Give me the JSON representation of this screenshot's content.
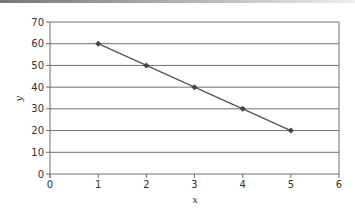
{
  "chart_data": {
    "type": "line",
    "title": "",
    "xlabel": "x",
    "ylabel": "y",
    "xlim": [
      0,
      6
    ],
    "ylim": [
      0,
      70
    ],
    "x_ticks": [
      "0",
      "1",
      "2",
      "3",
      "4",
      "5",
      "6"
    ],
    "y_ticks": [
      "0",
      "10",
      "20",
      "30",
      "40",
      "50",
      "60",
      "70"
    ],
    "grid": "horizontal",
    "legend": null,
    "series": [
      {
        "name": "y",
        "x": [
          1,
          2,
          3,
          4,
          5
        ],
        "values": [
          60,
          50,
          40,
          30,
          20
        ],
        "color": "#555555",
        "marker": "diamond"
      }
    ]
  }
}
